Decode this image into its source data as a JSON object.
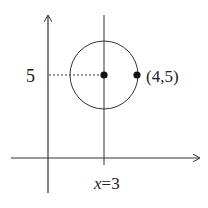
{
  "diagram": {
    "labels": {
      "y_value": "5",
      "point": "(4,5)",
      "line_var": "x",
      "line_rest": "=3"
    },
    "center": {
      "x": 3,
      "y": 5
    },
    "point_on_circle": {
      "x": 4,
      "y": 5
    },
    "radius": 1,
    "vertical_line_x": 3,
    "stroke_color": "#333333",
    "dot_color": "#111111"
  }
}
